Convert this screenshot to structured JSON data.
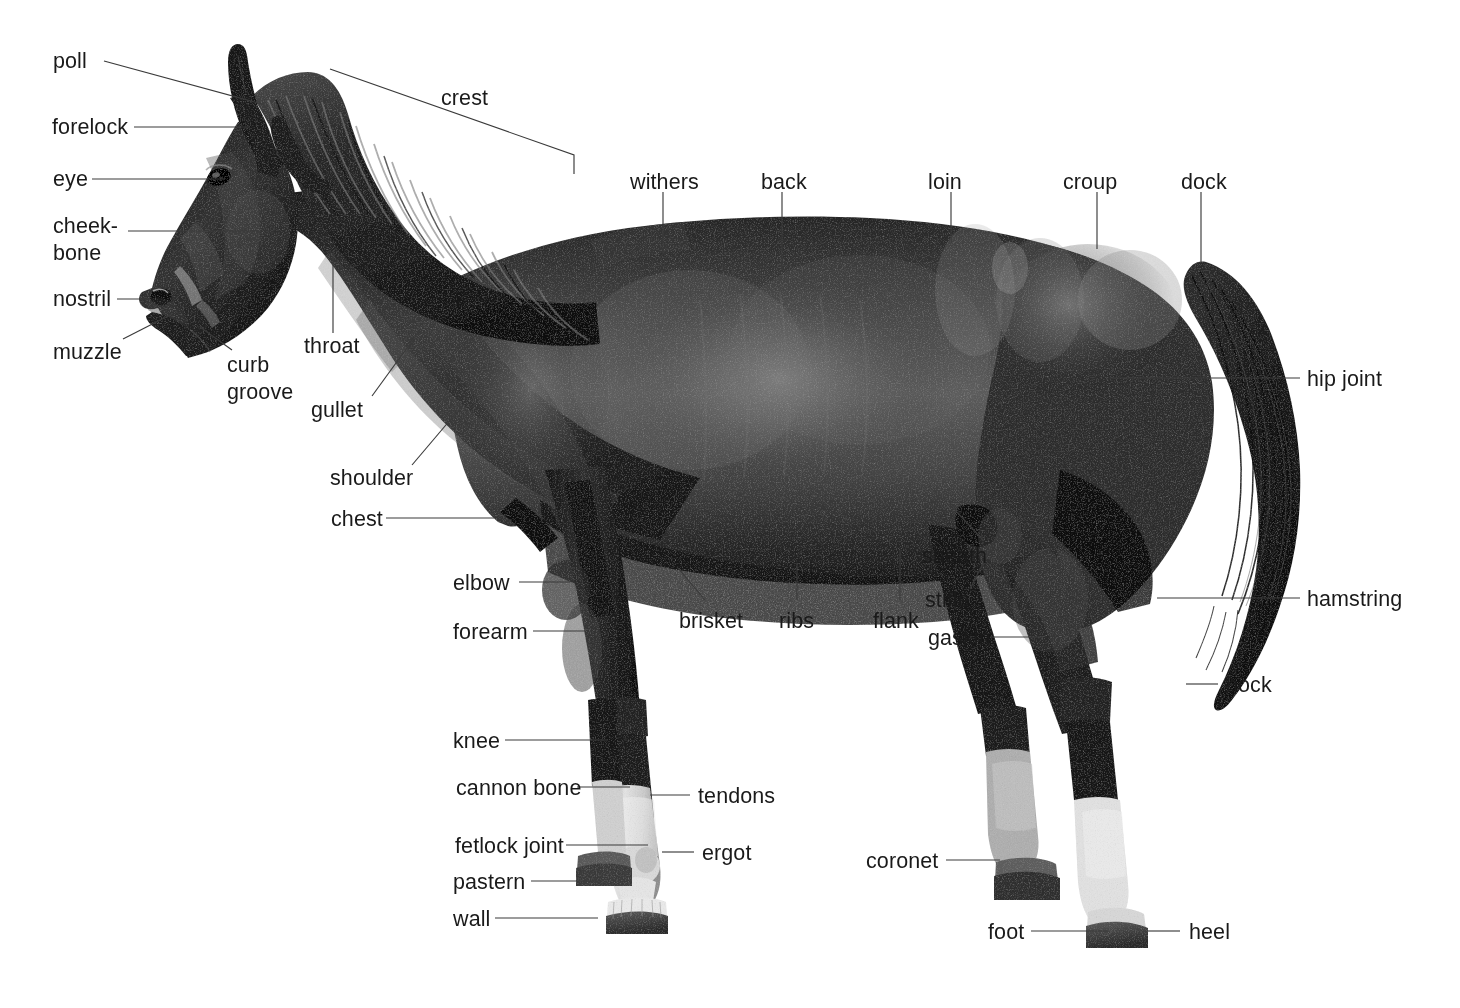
{
  "diagram": {
    "background_color": "#ffffff",
    "text_color": "#1a1a1a",
    "leader_line_color": "#3a3a3a",
    "image_type": "grayscale photograph of a dark bay horse in left profile stance"
  },
  "labels": {
    "poll": "poll",
    "forelock": "forelock",
    "eye": "eye",
    "cheekbone_line1": "cheek-",
    "cheekbone_line2": "bone",
    "nostril": "nostril",
    "muzzle": "muzzle",
    "curb_line1": "curb",
    "curb_line2": "groove",
    "throat": "throat",
    "gullet": "gullet",
    "shoulder": "shoulder",
    "chest": "chest",
    "crest": "crest",
    "withers": "withers",
    "back": "back",
    "loin": "loin",
    "croup": "croup",
    "dock": "dock",
    "hip_joint": "hip joint",
    "hamstring": "hamstring",
    "hock": "hock",
    "sheath": "sheath",
    "stifle": "stifle",
    "flank": "flank",
    "gaskin": "gaskin",
    "ribs": "ribs",
    "brisket": "brisket",
    "elbow": "elbow",
    "forearm": "forearm",
    "knee": "knee",
    "cannon_bone": "cannon bone",
    "tendons": "tendons",
    "fetlock_joint": "fetlock joint",
    "ergot": "ergot",
    "pastern": "pastern",
    "wall": "wall",
    "coronet": "coronet",
    "foot": "foot",
    "heel": "heel"
  }
}
